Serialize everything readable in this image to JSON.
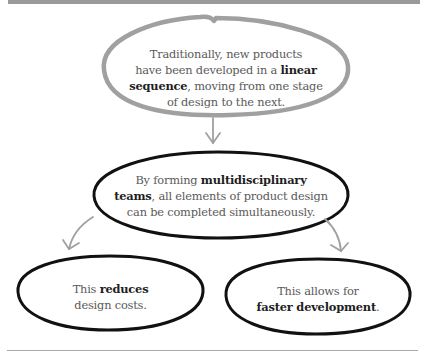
{
  "diagram": {
    "type": "flowchart",
    "colors": {
      "top_bar": "#9a9a9a",
      "gray_stroke": "#a0a0a0",
      "black_stroke": "#111111",
      "regular_text": "#5a5a5a",
      "bold_text": "#1e1e1e"
    },
    "nodes": {
      "top": {
        "lines": [
          {
            "pre": "Traditionally, new products",
            "bold": "",
            "post": ""
          },
          {
            "pre": "have been developed in a ",
            "bold": "linear",
            "post": ""
          },
          {
            "pre": "",
            "bold": "sequence",
            "post": ", moving from one stage"
          },
          {
            "pre": "of design to the next.",
            "bold": "",
            "post": ""
          }
        ]
      },
      "middle": {
        "lines": [
          {
            "pre": "By forming ",
            "bold": "multidisciplinary",
            "post": ""
          },
          {
            "pre": "",
            "bold": "teams",
            "post": ", all elements of product design"
          },
          {
            "pre": "can be completed simultaneously.",
            "bold": "",
            "post": ""
          }
        ]
      },
      "bottom_left": {
        "lines": [
          {
            "pre": "This ",
            "bold": "reduces",
            "post": ""
          },
          {
            "pre": "design costs.",
            "bold": "",
            "post": ""
          }
        ]
      },
      "bottom_right": {
        "lines": [
          {
            "pre": "This allows for",
            "bold": "",
            "post": ""
          },
          {
            "pre": "",
            "bold": "faster development",
            "post": "."
          }
        ]
      }
    },
    "edges": [
      {
        "from": "top",
        "to": "middle"
      },
      {
        "from": "middle",
        "to": "bottom_left"
      },
      {
        "from": "middle",
        "to": "bottom_right"
      }
    ]
  }
}
